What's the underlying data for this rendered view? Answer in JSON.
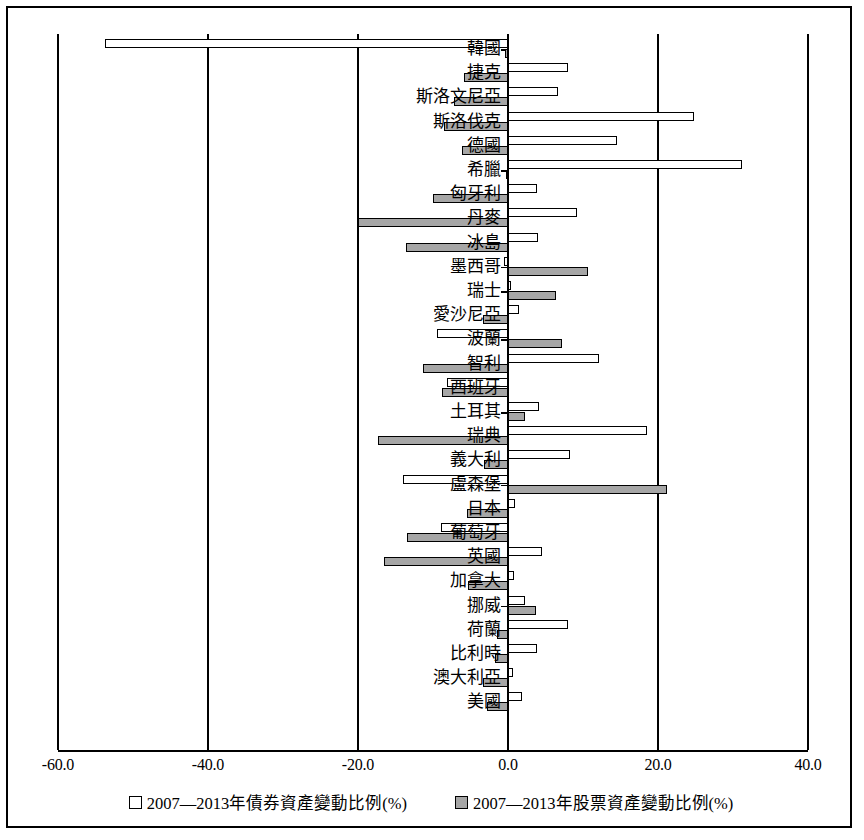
{
  "chart_data": {
    "type": "bar",
    "orientation": "horizontal",
    "title": "",
    "xlabel": "",
    "ylabel": "",
    "xlim": [
      -60.0,
      40.0
    ],
    "xticks": [
      "-60.0",
      "-40.0",
      "-20.0",
      "0.0",
      "20.0",
      "40.0"
    ],
    "xtick_values": [
      -60,
      -40,
      -20,
      0,
      20,
      40
    ],
    "grid": true,
    "legend_position": "bottom",
    "legend": [
      "2007—2013年債券資產變動比例(%)",
      "2007—2013年股票資產變動比例(%)"
    ],
    "categories": [
      "韓國",
      "捷克",
      "斯洛文尼亞",
      "斯洛伐克",
      "德國",
      "希臘",
      "匈牙利",
      "丹麥",
      "冰島",
      "墨西哥",
      "瑞士",
      "愛沙尼亞",
      "波蘭",
      "智利",
      "西班牙",
      "土耳其",
      "瑞典",
      "義大利",
      "盧森堡",
      "日本",
      "葡萄牙",
      "英國",
      "加拿大",
      "挪威",
      "荷蘭",
      "比利時",
      "澳大利亞",
      "美國"
    ],
    "series": [
      {
        "name": "2007—2013年債券資產變動比例(%)",
        "color": "#ffffff",
        "values": [
          -53.7,
          8.0,
          6.6,
          24.8,
          14.5,
          31.2,
          3.9,
          9.2,
          4.0,
          -0.5,
          0.3,
          1.5,
          -9.5,
          12.1,
          -8.1,
          4.1,
          18.5,
          8.2,
          -14.0,
          0.9,
          -9.0,
          4.5,
          0.8,
          2.3,
          8.0,
          3.8,
          0.6,
          1.8
        ]
      },
      {
        "name": "2007—2013年股票資產變動比例(%)",
        "color": "#a6a6a6",
        "values": [
          -0.4,
          -5.9,
          -7.2,
          -8.6,
          -6.2,
          -0.3,
          -10.0,
          -20.0,
          -13.6,
          10.7,
          6.4,
          -3.4,
          7.2,
          -11.3,
          -8.8,
          2.3,
          -17.4,
          -3.2,
          21.2,
          -5.5,
          -13.5,
          -16.5,
          -5.3,
          3.7,
          -1.5,
          -1.8,
          -3.3,
          -2.8
        ]
      }
    ]
  }
}
